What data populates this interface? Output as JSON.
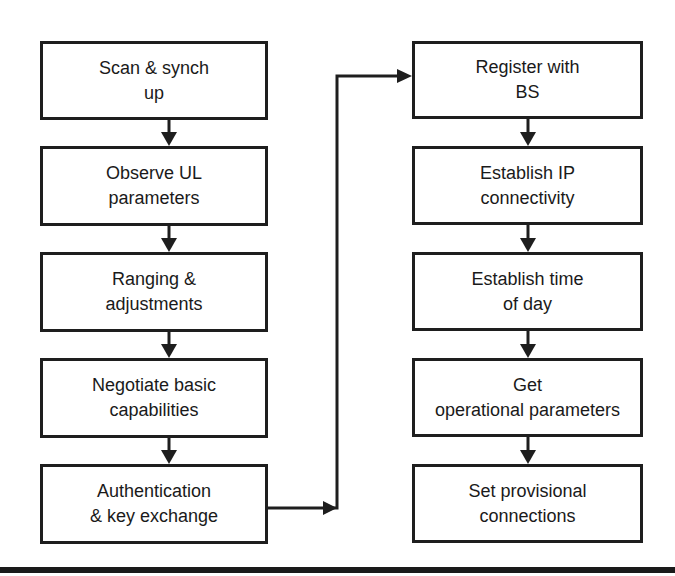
{
  "diagram": {
    "type": "flowchart",
    "colors": {
      "stroke": "#1e1e1e",
      "text": "#1a1a1a",
      "background": "#ffffff"
    },
    "left_column": [
      {
        "line1": "Scan & synch",
        "line2": "up"
      },
      {
        "line1": "Observe UL",
        "line2": "parameters"
      },
      {
        "line1": "Ranging &",
        "line2": "adjustments"
      },
      {
        "line1": "Negotiate basic",
        "line2": "capabilities"
      },
      {
        "line1": "Authentication",
        "line2": "& key exchange"
      }
    ],
    "right_column": [
      {
        "line1": "Register with",
        "line2": "BS"
      },
      {
        "line1": "Establish IP",
        "line2": "connectivity"
      },
      {
        "line1": "Establish time",
        "line2": "of day"
      },
      {
        "line1": "Get",
        "line2": "operational parameters"
      },
      {
        "line1": "Set provisional",
        "line2": "connections"
      }
    ],
    "edges": [
      {
        "from": "Scan & synch up",
        "to": "Observe UL parameters"
      },
      {
        "from": "Observe UL parameters",
        "to": "Ranging & adjustments"
      },
      {
        "from": "Ranging & adjustments",
        "to": "Negotiate basic capabilities"
      },
      {
        "from": "Negotiate basic capabilities",
        "to": "Authentication & key exchange"
      },
      {
        "from": "Authentication & key exchange",
        "to": "Register with BS"
      },
      {
        "from": "Register with BS",
        "to": "Establish IP connectivity"
      },
      {
        "from": "Establish IP connectivity",
        "to": "Establish time of day"
      },
      {
        "from": "Establish time of day",
        "to": "Get operational parameters"
      },
      {
        "from": "Get operational parameters",
        "to": "Set provisional connections"
      }
    ]
  }
}
